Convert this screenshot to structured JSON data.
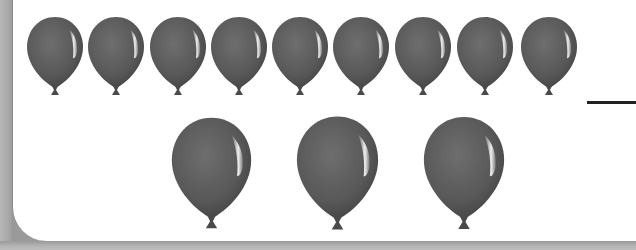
{
  "worksheet": {
    "task": "Count the balloons",
    "rows": [
      {
        "name": "top-row",
        "count": 9,
        "size": "small"
      },
      {
        "name": "bottom-row",
        "count": 3,
        "size": "large"
      }
    ],
    "answer_blank": "",
    "colors": {
      "balloon": "#5a5a5a",
      "highlight": "#f2f2f2",
      "border": "#ababab",
      "panel": "#ffffff",
      "answer_line": "#222222"
    }
  }
}
